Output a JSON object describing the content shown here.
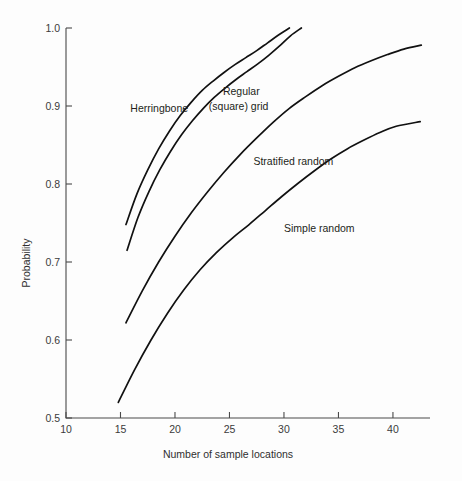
{
  "chart_data": {
    "type": "line",
    "title": "",
    "xlabel": "Number of sample locations",
    "ylabel": "Probability",
    "xlim": [
      10,
      43.4
    ],
    "ylim": [
      0.5,
      1.0
    ],
    "grid": false,
    "legend_position": "inline-annotations",
    "xticks": [
      10,
      15,
      20,
      25,
      30,
      35,
      40
    ],
    "xtick_labels": [
      "10",
      "15",
      "20",
      "25",
      "30",
      "35",
      "40"
    ],
    "yticks": [
      0.5,
      0.6,
      0.7,
      0.8,
      0.9,
      1.0
    ],
    "ytick_labels": [
      "0.5",
      "0.6",
      "0.7",
      "0.8",
      "0.9",
      "1.0"
    ],
    "series": [
      {
        "name": "Herringbone",
        "label": "Herringbone",
        "x": [
          15.5,
          16.5,
          17.5,
          18.5,
          19.5,
          20.5,
          21.5,
          22.5,
          23.5,
          24.5,
          25.5,
          26.5,
          27.5,
          28.5,
          29.5,
          30.5
        ],
        "values": [
          0.748,
          0.787,
          0.818,
          0.845,
          0.868,
          0.888,
          0.905,
          0.92,
          0.932,
          0.943,
          0.953,
          0.962,
          0.971,
          0.981,
          0.991,
          1.0
        ]
      },
      {
        "name": "Regular (square) grid",
        "label": "Regular\n(square) grid",
        "x": [
          15.6,
          16.6,
          17.6,
          18.6,
          19.6,
          20.6,
          21.6,
          22.6,
          23.6,
          24.6,
          25.6,
          26.6,
          27.6,
          28.6,
          29.6,
          30.6,
          31.6
        ],
        "values": [
          0.715,
          0.757,
          0.79,
          0.818,
          0.842,
          0.863,
          0.881,
          0.897,
          0.911,
          0.923,
          0.934,
          0.944,
          0.954,
          0.965,
          0.977,
          0.99,
          1.0
        ]
      },
      {
        "name": "Stratified random",
        "label": "Stratified random",
        "x": [
          15.5,
          17,
          18.5,
          20,
          21.5,
          23,
          24.5,
          26,
          27.5,
          29,
          30.5,
          32,
          33.5,
          35,
          36.5,
          38,
          39.5,
          41,
          42.6
        ],
        "values": [
          0.622,
          0.663,
          0.7,
          0.733,
          0.763,
          0.79,
          0.815,
          0.838,
          0.859,
          0.879,
          0.897,
          0.912,
          0.926,
          0.938,
          0.949,
          0.958,
          0.966,
          0.973,
          0.978
        ]
      },
      {
        "name": "Simple random",
        "label": "Simple random",
        "x": [
          14.8,
          16.3,
          17.8,
          19.3,
          20.8,
          22.3,
          23.8,
          25.3,
          26.8,
          28.3,
          29.8,
          31.3,
          32.8,
          34.3,
          35.8,
          37.3,
          38.8,
          40.3,
          42.5
        ],
        "values": [
          0.52,
          0.562,
          0.6,
          0.634,
          0.664,
          0.69,
          0.712,
          0.731,
          0.748,
          0.766,
          0.784,
          0.801,
          0.817,
          0.832,
          0.845,
          0.856,
          0.866,
          0.874,
          0.88
        ]
      }
    ],
    "annotations": [
      {
        "text": "Herringbone",
        "x": 15.9,
        "y": 0.896
      },
      {
        "text": "Regular",
        "x": 24.4,
        "y": 0.918
      },
      {
        "text": "(square) grid",
        "x": 23.1,
        "y": 0.899
      },
      {
        "text": "Stratified random",
        "x": 27.2,
        "y": 0.828
      },
      {
        "text": "Simple random",
        "x": 30.0,
        "y": 0.743
      }
    ]
  }
}
